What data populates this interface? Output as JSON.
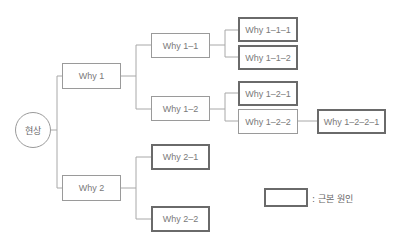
{
  "diagram": {
    "type": "5-why tree",
    "root": {
      "label": "현상"
    },
    "nodes": {
      "why1": {
        "label": "Why 1",
        "root_cause": false
      },
      "why2": {
        "label": "Why 2",
        "root_cause": false
      },
      "why1_1": {
        "label": "Why 1–1",
        "root_cause": false
      },
      "why1_2": {
        "label": "Why 1–2",
        "root_cause": false
      },
      "why1_1_1": {
        "label": "Why 1–1–1",
        "root_cause": true
      },
      "why1_1_2": {
        "label": "Why 1–1–2",
        "root_cause": true
      },
      "why1_2_1": {
        "label": "Why 1–2–1",
        "root_cause": true
      },
      "why1_2_2": {
        "label": "Why 1–2–2",
        "root_cause": false
      },
      "why1_2_2_1": {
        "label": "Why 1–2–2–1",
        "root_cause": true
      },
      "why2_1": {
        "label": "Why 2–1",
        "root_cause": true
      },
      "why2_2": {
        "label": "Why 2–2",
        "root_cause": true
      }
    },
    "legend": {
      "label": ": 근본 원인"
    },
    "colors": {
      "line": "#a8a8a8",
      "border": "#9a9a9a",
      "root_cause_border": "#6a6a6a",
      "text": "#7a7a7a"
    }
  }
}
